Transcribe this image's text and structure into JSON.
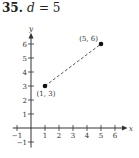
{
  "problem": {
    "number": "35.",
    "variable": "d",
    "equals": "= 5"
  },
  "chart_data": {
    "type": "scatter",
    "title": "35. d = 5",
    "xlabel": "x",
    "ylabel": "y",
    "xlim": [
      -1,
      6
    ],
    "ylim": [
      -1,
      7
    ],
    "x_ticks": [
      -1,
      1,
      2,
      3,
      4,
      5,
      6
    ],
    "y_ticks": [
      -1,
      1,
      2,
      3,
      4,
      5,
      6
    ],
    "grid": false,
    "points": [
      {
        "x": 1,
        "y": 3,
        "label": "(1, 3)"
      },
      {
        "x": 5,
        "y": 6,
        "label": "(5, 6)"
      }
    ],
    "segments": [
      {
        "from": [
          1,
          3
        ],
        "to": [
          5,
          6
        ],
        "style": "dashed"
      }
    ],
    "annotation": "d = 5"
  }
}
